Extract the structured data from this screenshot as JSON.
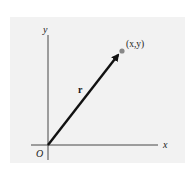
{
  "diagram": {
    "panel_color": "#f2f2f2",
    "axis_color": "#333333",
    "vector_color": "#111111",
    "point_color": "#888888",
    "axes": {
      "x_label": "x",
      "y_label": "y",
      "origin_label": "O"
    },
    "vector": {
      "label": "r"
    },
    "point": {
      "label": "(x,y)"
    }
  }
}
